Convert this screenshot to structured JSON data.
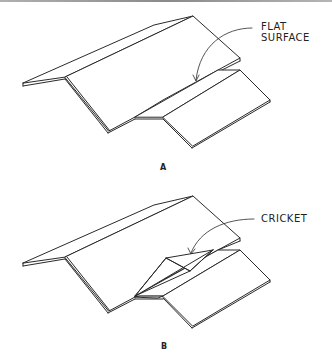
{
  "figure": {
    "panels": [
      {
        "label": "A",
        "callout": {
          "line1": "FLAT",
          "line2": "SURFACE"
        },
        "description": "Gable roof meeting a lower wing with a flat surface at the junction"
      },
      {
        "label": "B",
        "callout": {
          "line1": "CRICKET"
        },
        "description": "Gable roof meeting a lower wing with a cricket at the junction"
      }
    ]
  }
}
